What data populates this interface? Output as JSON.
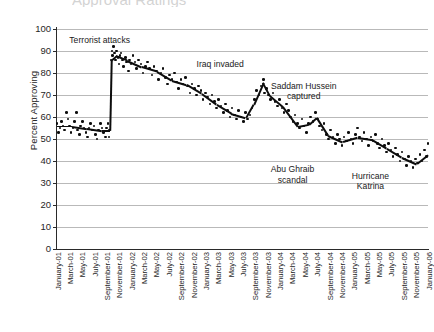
{
  "chart_data": {
    "type": "scatter",
    "title": "Approval Ratings",
    "title_truncated": true,
    "xlabel": "",
    "ylabel": "Percent Approving",
    "ylim": [
      0,
      100
    ],
    "ytick_step": 10,
    "yticks": [
      100,
      90,
      80,
      70,
      60,
      50,
      40,
      30,
      20,
      10,
      0
    ],
    "grid": "horizontal",
    "legend": "none",
    "categories": [
      "January-01",
      "March-01",
      "May-01",
      "July-01",
      "September-01",
      "November-01",
      "January-02",
      "March-02",
      "May-02",
      "July-02",
      "September-02",
      "November-02",
      "January-03",
      "March-03",
      "May-03",
      "July-03",
      "September-03",
      "November-03",
      "January-04",
      "March-04",
      "May-04",
      "July-04",
      "September-04",
      "November-04",
      "January-05",
      "March-05",
      "May-05",
      "July-05",
      "September-05",
      "November-05",
      "January-06"
    ],
    "annotations": [
      {
        "label": "Terrorist attacks",
        "x_pos": 0.115,
        "y_pos": 95
      },
      {
        "label": "Iraq invaded",
        "x_pos": 0.44,
        "y_pos": 84
      },
      {
        "label": "Saddam Hussein\ncaptured",
        "x_pos": 0.665,
        "y_pos": 72
      },
      {
        "label": "Abu Ghraib\nscandal",
        "x_pos": 0.635,
        "y_pos": 34
      },
      {
        "label": "Hurricane\nKatrina",
        "x_pos": 0.845,
        "y_pos": 31
      }
    ],
    "series": [
      {
        "name": "Presidential approval",
        "points": [
          {
            "t": 0.0,
            "v": 57
          },
          {
            "t": 0.004,
            "v": 53
          },
          {
            "t": 0.008,
            "v": 55
          },
          {
            "t": 0.012,
            "v": 58
          },
          {
            "t": 0.016,
            "v": 56
          },
          {
            "t": 0.021,
            "v": 54
          },
          {
            "t": 0.026,
            "v": 62
          },
          {
            "t": 0.03,
            "v": 59
          },
          {
            "t": 0.034,
            "v": 56
          },
          {
            "t": 0.038,
            "v": 53
          },
          {
            "t": 0.043,
            "v": 55
          },
          {
            "t": 0.047,
            "v": 58
          },
          {
            "t": 0.052,
            "v": 62
          },
          {
            "t": 0.056,
            "v": 54
          },
          {
            "t": 0.06,
            "v": 52
          },
          {
            "t": 0.064,
            "v": 56
          },
          {
            "t": 0.069,
            "v": 58
          },
          {
            "t": 0.073,
            "v": 55
          },
          {
            "t": 0.078,
            "v": 53
          },
          {
            "t": 0.082,
            "v": 51
          },
          {
            "t": 0.086,
            "v": 55
          },
          {
            "t": 0.091,
            "v": 57
          },
          {
            "t": 0.095,
            "v": 54
          },
          {
            "t": 0.1,
            "v": 56
          },
          {
            "t": 0.104,
            "v": 52
          },
          {
            "t": 0.108,
            "v": 50
          },
          {
            "t": 0.112,
            "v": 54
          },
          {
            "t": 0.117,
            "v": 57
          },
          {
            "t": 0.121,
            "v": 55
          },
          {
            "t": 0.125,
            "v": 53
          },
          {
            "t": 0.13,
            "v": 51
          },
          {
            "t": 0.134,
            "v": 55
          },
          {
            "t": 0.138,
            "v": 57
          },
          {
            "t": 0.14,
            "v": 51
          },
          {
            "t": 0.142,
            "v": 54
          },
          {
            "t": 0.146,
            "v": 86
          },
          {
            "t": 0.148,
            "v": 90
          },
          {
            "t": 0.15,
            "v": 88
          },
          {
            "t": 0.152,
            "v": 92
          },
          {
            "t": 0.155,
            "v": 89
          },
          {
            "t": 0.158,
            "v": 86
          },
          {
            "t": 0.161,
            "v": 90
          },
          {
            "t": 0.164,
            "v": 87
          },
          {
            "t": 0.167,
            "v": 84
          },
          {
            "t": 0.17,
            "v": 88
          },
          {
            "t": 0.173,
            "v": 89
          },
          {
            "t": 0.176,
            "v": 86
          },
          {
            "t": 0.18,
            "v": 83
          },
          {
            "t": 0.184,
            "v": 87
          },
          {
            "t": 0.188,
            "v": 85
          },
          {
            "t": 0.192,
            "v": 81
          },
          {
            "t": 0.196,
            "v": 86
          },
          {
            "t": 0.2,
            "v": 84
          },
          {
            "t": 0.205,
            "v": 88
          },
          {
            "t": 0.21,
            "v": 85
          },
          {
            "t": 0.215,
            "v": 82
          },
          {
            "t": 0.22,
            "v": 86
          },
          {
            "t": 0.226,
            "v": 84
          },
          {
            "t": 0.232,
            "v": 80
          },
          {
            "t": 0.238,
            "v": 83
          },
          {
            "t": 0.244,
            "v": 85
          },
          {
            "t": 0.25,
            "v": 82
          },
          {
            "t": 0.256,
            "v": 79
          },
          {
            "t": 0.262,
            "v": 83
          },
          {
            "t": 0.268,
            "v": 81
          },
          {
            "t": 0.274,
            "v": 77
          },
          {
            "t": 0.28,
            "v": 80
          },
          {
            "t": 0.286,
            "v": 82
          },
          {
            "t": 0.292,
            "v": 78
          },
          {
            "t": 0.298,
            "v": 75
          },
          {
            "t": 0.304,
            "v": 79
          },
          {
            "t": 0.31,
            "v": 77
          },
          {
            "t": 0.316,
            "v": 80
          },
          {
            "t": 0.322,
            "v": 76
          },
          {
            "t": 0.328,
            "v": 73
          },
          {
            "t": 0.334,
            "v": 77
          },
          {
            "t": 0.34,
            "v": 75
          },
          {
            "t": 0.346,
            "v": 78
          },
          {
            "t": 0.352,
            "v": 74
          },
          {
            "t": 0.358,
            "v": 71
          },
          {
            "t": 0.364,
            "v": 75
          },
          {
            "t": 0.37,
            "v": 73
          },
          {
            "t": 0.376,
            "v": 70
          },
          {
            "t": 0.382,
            "v": 74
          },
          {
            "t": 0.388,
            "v": 72
          },
          {
            "t": 0.394,
            "v": 68
          },
          {
            "t": 0.4,
            "v": 71
          },
          {
            "t": 0.406,
            "v": 69
          },
          {
            "t": 0.412,
            "v": 66
          },
          {
            "t": 0.418,
            "v": 70
          },
          {
            "t": 0.424,
            "v": 67
          },
          {
            "t": 0.43,
            "v": 64
          },
          {
            "t": 0.436,
            "v": 68
          },
          {
            "t": 0.442,
            "v": 65
          },
          {
            "t": 0.448,
            "v": 62
          },
          {
            "t": 0.454,
            "v": 66
          },
          {
            "t": 0.46,
            "v": 63
          },
          {
            "t": 0.466,
            "v": 60
          },
          {
            "t": 0.472,
            "v": 64
          },
          {
            "t": 0.478,
            "v": 61
          },
          {
            "t": 0.484,
            "v": 59
          },
          {
            "t": 0.49,
            "v": 63
          },
          {
            "t": 0.496,
            "v": 60
          },
          {
            "t": 0.502,
            "v": 58
          },
          {
            "t": 0.508,
            "v": 62
          },
          {
            "t": 0.514,
            "v": 59
          },
          {
            "t": 0.52,
            "v": 61
          },
          {
            "t": 0.526,
            "v": 64
          },
          {
            "t": 0.532,
            "v": 68
          },
          {
            "t": 0.538,
            "v": 72
          },
          {
            "t": 0.544,
            "v": 70
          },
          {
            "t": 0.55,
            "v": 74
          },
          {
            "t": 0.556,
            "v": 77
          },
          {
            "t": 0.56,
            "v": 71
          },
          {
            "t": 0.564,
            "v": 73
          },
          {
            "t": 0.57,
            "v": 70
          },
          {
            "t": 0.576,
            "v": 68
          },
          {
            "t": 0.582,
            "v": 71
          },
          {
            "t": 0.588,
            "v": 67
          },
          {
            "t": 0.594,
            "v": 65
          },
          {
            "t": 0.6,
            "v": 68
          },
          {
            "t": 0.606,
            "v": 64
          },
          {
            "t": 0.612,
            "v": 62
          },
          {
            "t": 0.618,
            "v": 66
          },
          {
            "t": 0.624,
            "v": 63
          },
          {
            "t": 0.63,
            "v": 60
          },
          {
            "t": 0.636,
            "v": 58
          },
          {
            "t": 0.642,
            "v": 61
          },
          {
            "t": 0.648,
            "v": 57
          },
          {
            "t": 0.654,
            "v": 55
          },
          {
            "t": 0.66,
            "v": 59
          },
          {
            "t": 0.666,
            "v": 56
          },
          {
            "t": 0.672,
            "v": 53
          },
          {
            "t": 0.678,
            "v": 57
          },
          {
            "t": 0.684,
            "v": 60
          },
          {
            "t": 0.69,
            "v": 58
          },
          {
            "t": 0.696,
            "v": 62
          },
          {
            "t": 0.702,
            "v": 59
          },
          {
            "t": 0.708,
            "v": 56
          },
          {
            "t": 0.714,
            "v": 54
          },
          {
            "t": 0.72,
            "v": 57
          },
          {
            "t": 0.726,
            "v": 52
          },
          {
            "t": 0.732,
            "v": 50
          },
          {
            "t": 0.738,
            "v": 54
          },
          {
            "t": 0.744,
            "v": 51
          },
          {
            "t": 0.75,
            "v": 48
          },
          {
            "t": 0.756,
            "v": 52
          },
          {
            "t": 0.762,
            "v": 50
          },
          {
            "t": 0.768,
            "v": 47
          },
          {
            "t": 0.774,
            "v": 51
          },
          {
            "t": 0.78,
            "v": 49
          },
          {
            "t": 0.786,
            "v": 53
          },
          {
            "t": 0.792,
            "v": 50
          },
          {
            "t": 0.798,
            "v": 48
          },
          {
            "t": 0.804,
            "v": 52
          },
          {
            "t": 0.81,
            "v": 55
          },
          {
            "t": 0.816,
            "v": 51
          },
          {
            "t": 0.822,
            "v": 49
          },
          {
            "t": 0.828,
            "v": 53
          },
          {
            "t": 0.834,
            "v": 50
          },
          {
            "t": 0.84,
            "v": 47
          },
          {
            "t": 0.846,
            "v": 51
          },
          {
            "t": 0.852,
            "v": 49
          },
          {
            "t": 0.858,
            "v": 52
          },
          {
            "t": 0.864,
            "v": 48
          },
          {
            "t": 0.87,
            "v": 46
          },
          {
            "t": 0.876,
            "v": 50
          },
          {
            "t": 0.882,
            "v": 47
          },
          {
            "t": 0.888,
            "v": 44
          },
          {
            "t": 0.894,
            "v": 48
          },
          {
            "t": 0.9,
            "v": 45
          },
          {
            "t": 0.906,
            "v": 42
          },
          {
            "t": 0.912,
            "v": 46
          },
          {
            "t": 0.918,
            "v": 43
          },
          {
            "t": 0.924,
            "v": 40
          },
          {
            "t": 0.93,
            "v": 44
          },
          {
            "t": 0.936,
            "v": 41
          },
          {
            "t": 0.942,
            "v": 38
          },
          {
            "t": 0.948,
            "v": 42
          },
          {
            "t": 0.954,
            "v": 40
          },
          {
            "t": 0.96,
            "v": 37
          },
          {
            "t": 0.966,
            "v": 41
          },
          {
            "t": 0.972,
            "v": 39
          },
          {
            "t": 0.978,
            "v": 43
          },
          {
            "t": 0.984,
            "v": 40
          },
          {
            "t": 0.99,
            "v": 45
          },
          {
            "t": 0.996,
            "v": 42
          },
          {
            "t": 1.0,
            "v": 48
          }
        ],
        "trend": [
          {
            "t": 0.0,
            "v": 56
          },
          {
            "t": 0.04,
            "v": 56
          },
          {
            "t": 0.08,
            "v": 55
          },
          {
            "t": 0.12,
            "v": 54
          },
          {
            "t": 0.142,
            "v": 54
          },
          {
            "t": 0.146,
            "v": 86
          },
          {
            "t": 0.16,
            "v": 88
          },
          {
            "t": 0.19,
            "v": 86
          },
          {
            "t": 0.23,
            "v": 83
          },
          {
            "t": 0.27,
            "v": 81
          },
          {
            "t": 0.31,
            "v": 77
          },
          {
            "t": 0.35,
            "v": 75
          },
          {
            "t": 0.39,
            "v": 71
          },
          {
            "t": 0.43,
            "v": 66
          },
          {
            "t": 0.47,
            "v": 62
          },
          {
            "t": 0.51,
            "v": 60
          },
          {
            "t": 0.53,
            "v": 66
          },
          {
            "t": 0.556,
            "v": 76
          },
          {
            "t": 0.575,
            "v": 70
          },
          {
            "t": 0.61,
            "v": 65
          },
          {
            "t": 0.65,
            "v": 56
          },
          {
            "t": 0.68,
            "v": 57
          },
          {
            "t": 0.7,
            "v": 60
          },
          {
            "t": 0.73,
            "v": 52
          },
          {
            "t": 0.77,
            "v": 49
          },
          {
            "t": 0.81,
            "v": 51
          },
          {
            "t": 0.85,
            "v": 50
          },
          {
            "t": 0.89,
            "v": 46
          },
          {
            "t": 0.93,
            "v": 42
          },
          {
            "t": 0.97,
            "v": 39
          },
          {
            "t": 1.0,
            "v": 43
          }
        ]
      }
    ]
  }
}
